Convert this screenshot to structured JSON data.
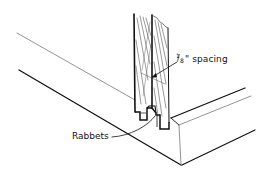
{
  "diagram": {
    "type": "technical-illustration",
    "colors": {
      "background": "#ffffff",
      "ink": "#111111",
      "light_line": "#777777"
    },
    "labels": {
      "spacing": {
        "fraction_numerator": "1",
        "fraction_slash": "/",
        "fraction_denominator": "8",
        "inch_mark": "\"",
        "text": " spacing"
      },
      "rabbets": {
        "text": "Rabbets"
      }
    },
    "parts": [
      {
        "name": "left-vertical-board",
        "description": "wood-grain board, left of seam"
      },
      {
        "name": "right-vertical-board",
        "description": "wood-grain board, right of seam"
      },
      {
        "name": "rabbet-joint",
        "description": "interlocking rabbets at board bottoms"
      },
      {
        "name": "frame-rail",
        "description": "horizontal rail in perspective with front end face"
      }
    ]
  }
}
